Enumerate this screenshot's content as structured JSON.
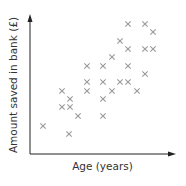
{
  "chart_data": {
    "type": "scatter",
    "title": "",
    "xlabel": "Age (years)",
    "ylabel": "Amount saved in bank (£)",
    "x_ticks": [],
    "y_ticks": [],
    "grid": false,
    "legend": null,
    "marker": "x",
    "marker_color": "#9a9a9a",
    "axis_color": "#222222",
    "xlim": [
      0,
      145
    ],
    "ylim": [
      0,
      139
    ],
    "note": "No numeric scale shown; values are relative positions from the axis origin (x rightward, y upward).",
    "points": [
      {
        "x": 98,
        "y": 130
      },
      {
        "x": 115,
        "y": 130
      },
      {
        "x": 123,
        "y": 122
      },
      {
        "x": 90,
        "y": 113
      },
      {
        "x": 98,
        "y": 105
      },
      {
        "x": 115,
        "y": 105
      },
      {
        "x": 123,
        "y": 105
      },
      {
        "x": 82,
        "y": 97
      },
      {
        "x": 57,
        "y": 88
      },
      {
        "x": 73,
        "y": 88
      },
      {
        "x": 98,
        "y": 88
      },
      {
        "x": 115,
        "y": 80
      },
      {
        "x": 57,
        "y": 72
      },
      {
        "x": 73,
        "y": 72
      },
      {
        "x": 90,
        "y": 72
      },
      {
        "x": 98,
        "y": 72
      },
      {
        "x": 32,
        "y": 63
      },
      {
        "x": 57,
        "y": 63
      },
      {
        "x": 82,
        "y": 63
      },
      {
        "x": 107,
        "y": 63
      },
      {
        "x": 40,
        "y": 55
      },
      {
        "x": 73,
        "y": 55
      },
      {
        "x": 32,
        "y": 47
      },
      {
        "x": 40,
        "y": 47
      },
      {
        "x": 48,
        "y": 38
      },
      {
        "x": 73,
        "y": 38
      },
      {
        "x": 13,
        "y": 28
      },
      {
        "x": 39,
        "y": 20
      }
    ]
  },
  "axes": {
    "x_label": "Age (years)",
    "y_label": "Amount saved in bank (£)"
  }
}
